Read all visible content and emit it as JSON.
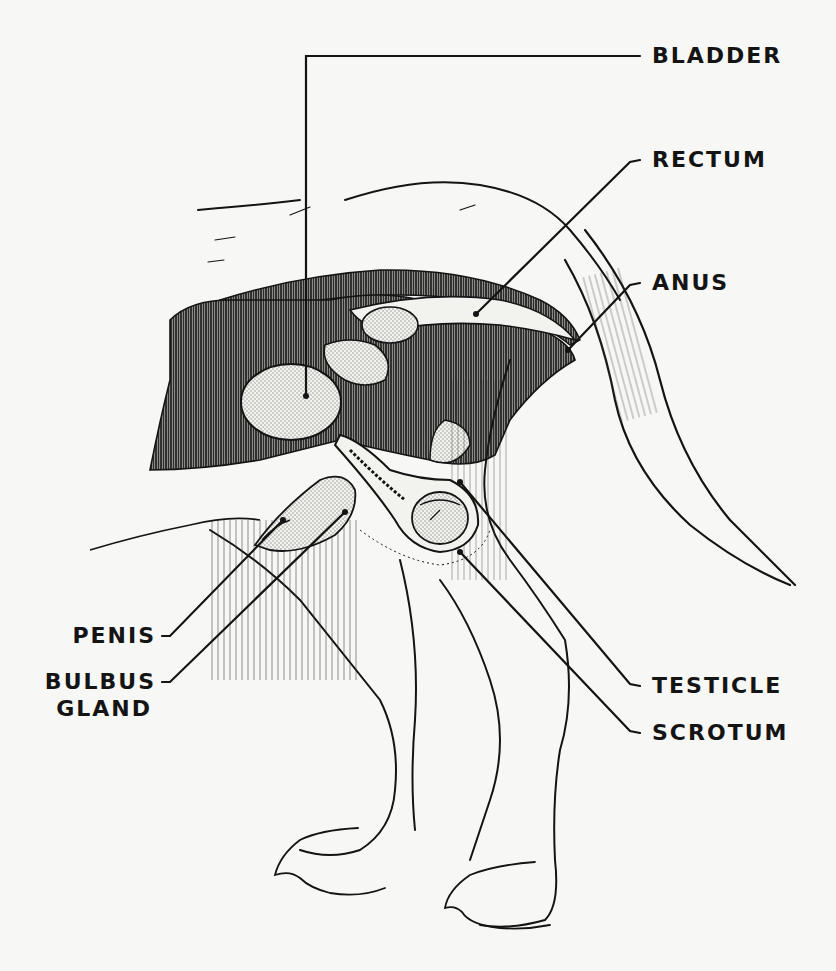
{
  "diagram": {
    "colors": {
      "ink": "#141414",
      "paper": "#f7f7f5",
      "stipple": "#d9d9d6",
      "dark_tissue": "#3a3a3a"
    },
    "labels": {
      "bladder": "BLADDER",
      "rectum": "RECTUM",
      "anus": "ANUS",
      "testicle": "TESTICLE",
      "scrotum": "SCROTUM",
      "penis": "PENIS",
      "bulbus_line1": "BULBUS",
      "bulbus_line2": "GLAND"
    }
  }
}
